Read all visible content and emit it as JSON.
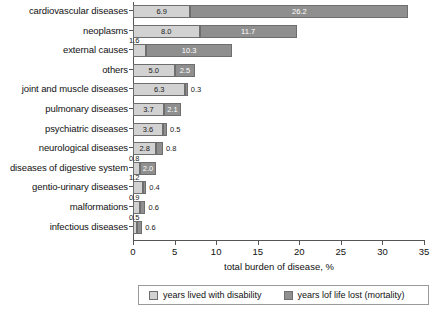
{
  "chart_data": {
    "type": "bar",
    "orientation": "horizontal",
    "stacked": true,
    "title": "",
    "xlabel": "total burden of disease, %",
    "ylabel": "",
    "xlim": [
      0,
      35
    ],
    "xticks": [
      0,
      5,
      10,
      15,
      20,
      25,
      30,
      35
    ],
    "grid": false,
    "legend_position": "bottom",
    "categories": [
      "cardiovascular diseases",
      "neoplasms",
      "external causes",
      "others",
      "joint and muscle diseases",
      "pulmonary diseases",
      "psychiatric diseases",
      "neurological diseases",
      "diseases of digestive system",
      "gentio-urinary diseases",
      "malformations",
      "infectious diseases"
    ],
    "series": [
      {
        "name": "years lived with disability",
        "color": "#d2d2d2",
        "values": [
          6.9,
          8.0,
          1.6,
          5.0,
          6.3,
          3.7,
          3.6,
          2.8,
          0.8,
          1.2,
          0.9,
          0.5
        ]
      },
      {
        "name": "years lof life lost (mortality)",
        "color": "#8f8f8f",
        "values": [
          26.2,
          11.7,
          10.3,
          2.5,
          0.3,
          2.1,
          0.5,
          0.8,
          2.0,
          0.4,
          0.6,
          0.6
        ]
      }
    ],
    "labels": {
      "light": [
        "6.9",
        "8.0",
        "1.6",
        "5.0",
        "6.3",
        "3.7",
        "3.6",
        "2.8",
        "0.8",
        "1.2",
        "0.9",
        "0.5"
      ],
      "dark": [
        "26.2",
        "11.7",
        "10.3",
        "2.5",
        "0.3",
        "2.1",
        "0.5",
        "0.8",
        "2.0",
        "0.4",
        "0.6",
        "0.6"
      ]
    }
  },
  "axis": {
    "x_title": "total burden of disease, %",
    "tick_labels": [
      "0",
      "5",
      "10",
      "15",
      "20",
      "25",
      "30",
      "35"
    ]
  },
  "legend": {
    "items": [
      {
        "label": "years lived with disability",
        "color": "#d2d2d2"
      },
      {
        "label": "years lof life lost (mortality)",
        "color": "#8f8f8f"
      }
    ]
  },
  "colors": {
    "disability": "#d2d2d2",
    "mortality": "#8f8f8f",
    "axis": "#555555",
    "text": "#111111",
    "background": "#ffffff"
  }
}
